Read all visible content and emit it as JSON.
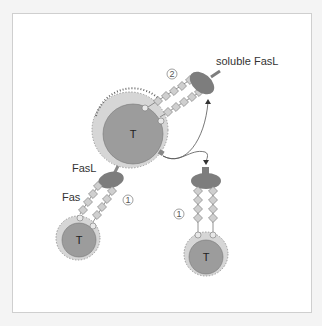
{
  "diagram": {
    "labels": {
      "soluble_fasl": "soluble FasL",
      "fasl": "FasL",
      "fas": "Fas",
      "step1_left": "1",
      "step1_right": "1",
      "step2": "2"
    },
    "cells": [
      {
        "id": "center",
        "label": "T"
      },
      {
        "id": "bottom-left",
        "label": "T"
      },
      {
        "id": "bottom-right",
        "label": "T"
      }
    ],
    "colors": {
      "cell_body": "#9c9c9c",
      "cell_ring": "#d6d6d6",
      "ligand": "#7d7d7d",
      "receptor": "#cfcfcf",
      "line": "#555555"
    }
  }
}
